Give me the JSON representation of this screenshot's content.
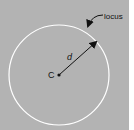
{
  "diagram": {
    "center_label": "C",
    "radius_label": "d",
    "locus_label": "locus",
    "colors": {
      "background": "#b3b3b3",
      "circle": "#ffffff",
      "ink": "#111111"
    }
  }
}
